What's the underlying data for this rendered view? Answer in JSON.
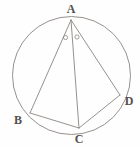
{
  "figure": {
    "kind": "geometry-diagram",
    "background_color": "#fefefe",
    "stroke_color": "#8a8580",
    "label_color": "#55504d",
    "stroke_width": 0.9
  },
  "circle": {
    "name": "circumcircle",
    "cx": 71.5,
    "cy": 75.5,
    "r": 59
  },
  "points": [
    {
      "id": "A",
      "label": "A",
      "x": 71,
      "y": 20,
      "label_x": 71,
      "label_y": 9
    },
    {
      "id": "B",
      "label": "B",
      "x": 30,
      "y": 113,
      "label_x": 18,
      "label_y": 120
    },
    {
      "id": "C",
      "label": "C",
      "x": 79,
      "y": 128,
      "label_x": 79,
      "label_y": 139
    },
    {
      "id": "D",
      "label": "D",
      "x": 120,
      "y": 95,
      "label_x": 129,
      "label_y": 101
    }
  ],
  "segments": [
    {
      "id": "AB",
      "from": "A",
      "to": "B",
      "x1": 71,
      "y1": 20,
      "x2": 30,
      "y2": 113
    },
    {
      "id": "AC",
      "from": "A",
      "to": "C",
      "x1": 71,
      "y1": 20,
      "x2": 79,
      "y2": 128
    },
    {
      "id": "AD",
      "from": "A",
      "to": "D",
      "x1": 71,
      "y1": 20,
      "x2": 120,
      "y2": 95
    },
    {
      "id": "BC",
      "from": "B",
      "to": "C",
      "x1": 30,
      "y1": 113,
      "x2": 79,
      "y2": 128
    },
    {
      "id": "CD",
      "from": "C",
      "to": "D",
      "x1": 79,
      "y1": 128,
      "x2": 120,
      "y2": 95
    }
  ],
  "angle_marks": [
    {
      "id": "angle-BAC",
      "glyph": "o",
      "cx": 65.5,
      "cy": 37.5,
      "r": 2.1
    },
    {
      "id": "angle-CAD",
      "glyph": "o",
      "cx": 77.0,
      "cy": 37.0,
      "r": 2.1
    }
  ]
}
